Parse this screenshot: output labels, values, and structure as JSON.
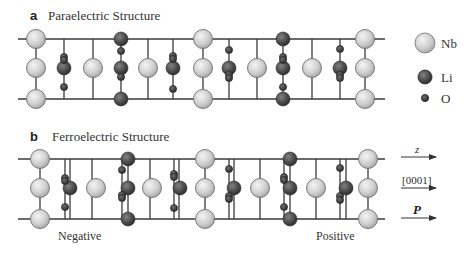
{
  "panel_a": {
    "letter": "a",
    "title": "Paraelectric Structure",
    "rails": {
      "top_y": 39,
      "mid_y": 68,
      "bottom_y": 99,
      "x_start": 18,
      "x_end": 385
    },
    "verticals": [
      36,
      64,
      93,
      121,
      148,
      173,
      203,
      229,
      257,
      283,
      312,
      340,
      365
    ],
    "atoms": [
      {
        "el": "Nb",
        "x": 36,
        "y": 39
      },
      {
        "el": "Nb",
        "x": 36,
        "y": 68
      },
      {
        "el": "Nb",
        "x": 36,
        "y": 99
      },
      {
        "el": "O",
        "x": 64,
        "y": 57
      },
      {
        "el": "O",
        "x": 64,
        "y": 60
      },
      {
        "el": "Li",
        "x": 64,
        "y": 68
      },
      {
        "el": "O",
        "x": 64,
        "y": 87
      },
      {
        "el": "Nb",
        "x": 93,
        "y": 68
      },
      {
        "el": "Li",
        "x": 121,
        "y": 39
      },
      {
        "el": "O",
        "x": 121,
        "y": 51
      },
      {
        "el": "Li",
        "x": 121,
        "y": 68
      },
      {
        "el": "O",
        "x": 121,
        "y": 77
      },
      {
        "el": "Li",
        "x": 121,
        "y": 99
      },
      {
        "el": "Nb",
        "x": 148,
        "y": 68
      },
      {
        "el": "O",
        "x": 173,
        "y": 56
      },
      {
        "el": "O",
        "x": 173,
        "y": 59
      },
      {
        "el": "Li",
        "x": 173,
        "y": 68
      },
      {
        "el": "O",
        "x": 173,
        "y": 89
      },
      {
        "el": "Nb",
        "x": 203,
        "y": 39
      },
      {
        "el": "Nb",
        "x": 203,
        "y": 68
      },
      {
        "el": "Nb",
        "x": 203,
        "y": 99
      },
      {
        "el": "O",
        "x": 229,
        "y": 50
      },
      {
        "el": "Li",
        "x": 229,
        "y": 68
      },
      {
        "el": "O",
        "x": 229,
        "y": 75
      },
      {
        "el": "O",
        "x": 229,
        "y": 78
      },
      {
        "el": "Nb",
        "x": 257,
        "y": 68
      },
      {
        "el": "Li",
        "x": 283,
        "y": 39
      },
      {
        "el": "O",
        "x": 283,
        "y": 57
      },
      {
        "el": "O",
        "x": 283,
        "y": 60
      },
      {
        "el": "Li",
        "x": 283,
        "y": 68
      },
      {
        "el": "O",
        "x": 283,
        "y": 87
      },
      {
        "el": "Li",
        "x": 283,
        "y": 99
      },
      {
        "el": "Nb",
        "x": 312,
        "y": 68
      },
      {
        "el": "O",
        "x": 340,
        "y": 49
      },
      {
        "el": "Li",
        "x": 340,
        "y": 68
      },
      {
        "el": "O",
        "x": 340,
        "y": 75
      },
      {
        "el": "O",
        "x": 340,
        "y": 78
      },
      {
        "el": "Nb",
        "x": 365,
        "y": 39
      },
      {
        "el": "Nb",
        "x": 365,
        "y": 68
      },
      {
        "el": "Nb",
        "x": 365,
        "y": 99
      }
    ]
  },
  "panel_b": {
    "letter": "b",
    "title": "Ferroelectric Structure",
    "rails": {
      "top_y": 159,
      "mid_y": 188,
      "bottom_y": 219,
      "x_start": 18,
      "x_end": 385
    },
    "verticals": [
      40,
      65,
      70,
      92,
      122,
      128,
      150,
      174,
      179,
      205,
      229,
      234,
      260,
      284,
      290,
      316,
      340,
      346,
      368
    ],
    "atoms": [
      {
        "el": "Nb",
        "x": 40,
        "y": 159
      },
      {
        "el": "Nb",
        "x": 40,
        "y": 188
      },
      {
        "el": "Nb",
        "x": 40,
        "y": 219
      },
      {
        "el": "O",
        "x": 65,
        "y": 178
      },
      {
        "el": "O",
        "x": 65,
        "y": 181
      },
      {
        "el": "Li",
        "x": 70,
        "y": 188
      },
      {
        "el": "O",
        "x": 65,
        "y": 207
      },
      {
        "el": "Nb",
        "x": 96,
        "y": 188
      },
      {
        "el": "Li",
        "x": 128,
        "y": 159
      },
      {
        "el": "O",
        "x": 122,
        "y": 170
      },
      {
        "el": "Li",
        "x": 128,
        "y": 188
      },
      {
        "el": "O",
        "x": 122,
        "y": 195
      },
      {
        "el": "O",
        "x": 122,
        "y": 198
      },
      {
        "el": "Li",
        "x": 128,
        "y": 219
      },
      {
        "el": "Nb",
        "x": 152,
        "y": 188
      },
      {
        "el": "O",
        "x": 174,
        "y": 174
      },
      {
        "el": "O",
        "x": 174,
        "y": 177
      },
      {
        "el": "Li",
        "x": 180,
        "y": 188
      },
      {
        "el": "O",
        "x": 174,
        "y": 208
      },
      {
        "el": "Nb",
        "x": 205,
        "y": 159
      },
      {
        "el": "Nb",
        "x": 205,
        "y": 188
      },
      {
        "el": "Nb",
        "x": 205,
        "y": 219
      },
      {
        "el": "O",
        "x": 229,
        "y": 169
      },
      {
        "el": "Li",
        "x": 234,
        "y": 188
      },
      {
        "el": "O",
        "x": 229,
        "y": 196
      },
      {
        "el": "O",
        "x": 229,
        "y": 199
      },
      {
        "el": "Nb",
        "x": 260,
        "y": 188
      },
      {
        "el": "Li",
        "x": 290,
        "y": 159
      },
      {
        "el": "O",
        "x": 284,
        "y": 177
      },
      {
        "el": "O",
        "x": 284,
        "y": 180
      },
      {
        "el": "Li",
        "x": 290,
        "y": 188
      },
      {
        "el": "O",
        "x": 284,
        "y": 207
      },
      {
        "el": "Li",
        "x": 290,
        "y": 219
      },
      {
        "el": "Nb",
        "x": 316,
        "y": 188
      },
      {
        "el": "O",
        "x": 340,
        "y": 168
      },
      {
        "el": "Li",
        "x": 346,
        "y": 188
      },
      {
        "el": "O",
        "x": 340,
        "y": 196
      },
      {
        "el": "O",
        "x": 340,
        "y": 200
      },
      {
        "el": "Nb",
        "x": 368,
        "y": 159
      },
      {
        "el": "Nb",
        "x": 368,
        "y": 188
      },
      {
        "el": "Nb",
        "x": 368,
        "y": 219
      }
    ],
    "negative_label": "Negative",
    "positive_label": "Positive"
  },
  "legend": {
    "items": [
      {
        "el": "Nb",
        "label": "Nb",
        "x": 425,
        "y": 43
      },
      {
        "el": "Li",
        "label": "Li",
        "x": 425,
        "y": 77
      },
      {
        "el": "O",
        "label": "O",
        "x": 425,
        "y": 98
      }
    ]
  },
  "arrows": [
    {
      "label": "z",
      "y": 157,
      "style": "italic"
    },
    {
      "label": "[0001]",
      "y": 188,
      "style": "normal"
    },
    {
      "label": "P",
      "y": 218,
      "style": "bold-italic"
    }
  ],
  "atom_radius": {
    "Nb": 9.5,
    "Li": 7,
    "O": 3.6
  },
  "colors": {
    "nb_light": "#f0f0f0",
    "nb_dark": "#a9a9a9",
    "nb_stroke": "#6f6f6f",
    "li_light": "#7a7a7a",
    "li_dark": "#2e2e2e",
    "o_light": "#666666",
    "o_dark": "#262626",
    "bond": "#3a3a3a"
  }
}
